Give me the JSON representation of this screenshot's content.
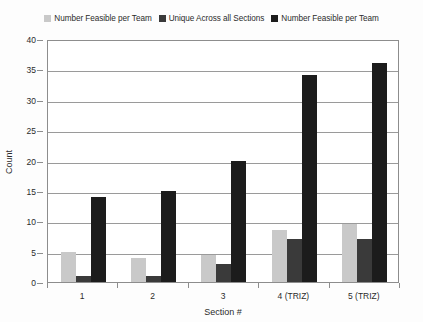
{
  "chart_data": {
    "type": "bar",
    "title": "",
    "subtitle": "",
    "xlabel": "Section #",
    "ylabel": "Count",
    "categories": [
      "1",
      "2",
      "3",
      "4 (TRIZ)",
      "5 (TRIZ)"
    ],
    "series": [
      {
        "name": "Number Feasible per Team",
        "color": "#c9c9c9",
        "values": [
          5,
          4,
          4.5,
          8.5,
          9.5
        ]
      },
      {
        "name": "Unique Across all Sections",
        "color": "#3a3a3a",
        "values": [
          1,
          1,
          3,
          7,
          7
        ]
      },
      {
        "name": "Number Feasible per Team",
        "color": "#1c1c1c",
        "values": [
          14,
          15,
          20,
          34,
          36
        ]
      }
    ],
    "ylim": [
      0,
      40
    ],
    "y_ticks": [
      0,
      5,
      10,
      15,
      20,
      25,
      30,
      35,
      40
    ],
    "grid": true,
    "legend_position": "top"
  },
  "axes": {
    "y_title": "Count",
    "x_title": "Section #"
  },
  "colors": {
    "series_light": "#c9c9c9",
    "series_mid": "#3a3a3a",
    "series_dark": "#1c1c1c",
    "grid": "#9a9a9a",
    "frame": "#8d8d8d",
    "text": "#2b2b2b",
    "background": "#fdfdfd"
  }
}
